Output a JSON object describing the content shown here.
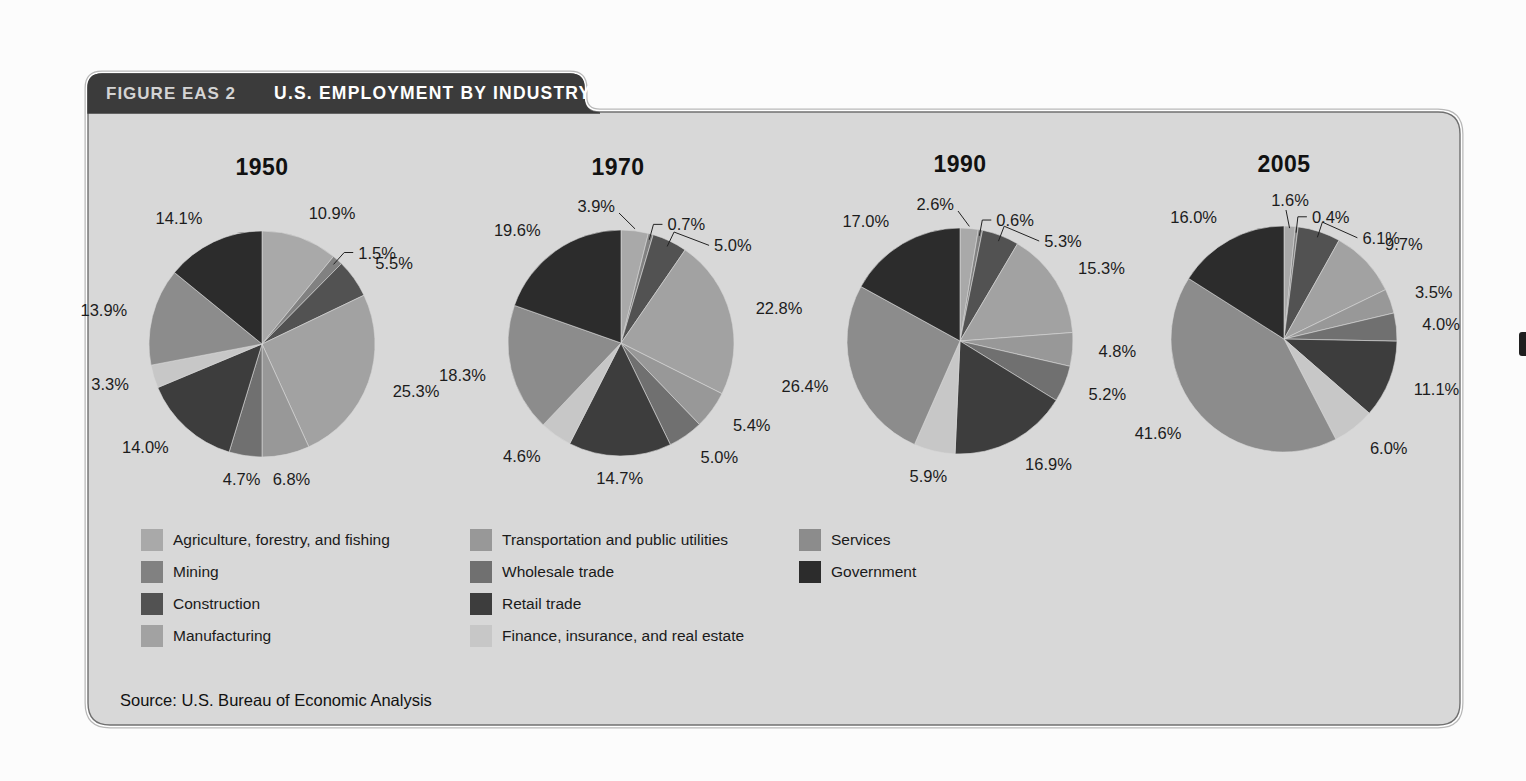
{
  "figure": {
    "label": "FIGURE EAS 2",
    "title": "U.S. EMPLOYMENT BY INDUSTRY",
    "source": "Source: U.S. Bureau of Economic Analysis"
  },
  "colors": {
    "page_background": "#fcfcfc",
    "panel_background": "#d8d8d8",
    "tab_background": "#3b3b3b",
    "tab_label_text": "#d4d4d4",
    "tab_title_text": "#ffffff",
    "percent_label_text": "#1c1c1c",
    "frame_inner_line": "#707070",
    "frame_outer_line": "#b8b8b8"
  },
  "chart_data": {
    "type": "pie",
    "title": "U.S. EMPLOYMENT BY INDUSTRY",
    "categories": [
      "Agriculture, forestry, and fishing",
      "Mining",
      "Construction",
      "Manufacturing",
      "Transportation and public utilities",
      "Wholesale trade",
      "Retail trade",
      "Finance, insurance, and real estate",
      "Services",
      "Government"
    ],
    "colors": [
      "#a9a9a9",
      "#818181",
      "#525252",
      "#a2a2a2",
      "#989898",
      "#707070",
      "#3d3d3d",
      "#c7c7c7",
      "#8c8c8c",
      "#2c2c2c"
    ],
    "series": [
      {
        "name": "1950",
        "values": [
          10.9,
          1.5,
          5.5,
          25.3,
          6.8,
          4.7,
          14.0,
          3.3,
          13.9,
          14.1
        ]
      },
      {
        "name": "1970",
        "values": [
          3.9,
          0.7,
          5.0,
          22.8,
          5.4,
          5.0,
          14.7,
          4.6,
          18.3,
          19.6
        ]
      },
      {
        "name": "1990",
        "values": [
          2.6,
          0.6,
          5.3,
          15.3,
          4.8,
          5.2,
          16.9,
          5.9,
          26.4,
          17.0
        ]
      },
      {
        "name": "2005",
        "values": [
          1.6,
          0.4,
          6.1,
          9.7,
          3.5,
          4.0,
          11.1,
          6.0,
          41.6,
          16.0
        ]
      }
    ],
    "label_format": "{value}%",
    "legend_position": "bottom",
    "start_angle": "12-o'clock, clockwise, legend order"
  }
}
